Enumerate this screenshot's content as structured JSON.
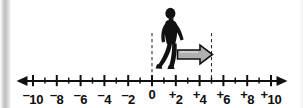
{
  "figure": {
    "background_color": "#ffffff",
    "ink_color": "#111111",
    "arrow_fill_color": "#b0b0b0",
    "arrow_stroke_color": "#111111",
    "dash_color": "#333333"
  },
  "number_line": {
    "min": -10,
    "max": 10,
    "tick_step": 1,
    "label_step": 2,
    "left_arrowhead": true,
    "right_arrowhead": true,
    "labels": [
      {
        "value": -10,
        "sign": "⁻",
        "digits": "10",
        "text": "⁻10"
      },
      {
        "value": -8,
        "sign": "⁻",
        "digits": "8",
        "text": "⁻8"
      },
      {
        "value": -6,
        "sign": "⁻",
        "digits": "6",
        "text": "⁻6"
      },
      {
        "value": -4,
        "sign": "⁻",
        "digits": "4",
        "text": "⁻4"
      },
      {
        "value": -2,
        "sign": "⁻",
        "digits": "2",
        "text": "⁻2"
      },
      {
        "value": 0,
        "sign": "",
        "digits": "0",
        "text": "0"
      },
      {
        "value": 2,
        "sign": "⁺",
        "digits": "2",
        "text": "⁺2"
      },
      {
        "value": 4,
        "sign": "⁺",
        "digits": "4",
        "text": "⁺4"
      },
      {
        "value": 6,
        "sign": "⁺",
        "digits": "6",
        "text": "⁺6"
      },
      {
        "value": 8,
        "sign": "⁺",
        "digits": "8",
        "text": "⁺8"
      },
      {
        "value": 10,
        "sign": "⁺",
        "digits": "10",
        "text": "⁺10"
      }
    ]
  },
  "figures": {
    "person": {
      "name": "walking-person",
      "position_value": 0,
      "facing": "right",
      "color": "#111111"
    },
    "motion_arrow": {
      "name": "motion-arrow",
      "from_value": 0.7,
      "to_value": 5,
      "direction": "right",
      "fill": "#b0b0b0",
      "stroke": "#111111"
    },
    "guide_lines": [
      {
        "name": "start-guide",
        "value": 0,
        "style": "dashed"
      },
      {
        "name": "end-guide",
        "value": 5,
        "style": "dashed"
      }
    ]
  },
  "chart_data": {
    "type": "line",
    "xlabel": "",
    "ylabel": "",
    "xlim": [
      -10,
      10
    ],
    "grid": false,
    "x": [
      -10,
      -9,
      -8,
      -7,
      -6,
      -5,
      -4,
      -3,
      -2,
      -1,
      0,
      1,
      2,
      3,
      4,
      5,
      6,
      7,
      8,
      9,
      10
    ],
    "tick_labels": [
      "⁻10",
      "",
      "⁻8",
      "",
      "⁻6",
      "",
      "⁻4",
      "",
      "⁻2",
      "",
      "0",
      "",
      "⁺2",
      "",
      "⁺4",
      "",
      "⁺6",
      "",
      "⁺8",
      "",
      "⁺10"
    ],
    "major_ticks": [
      -10,
      -8,
      -6,
      -4,
      -2,
      0,
      2,
      4,
      6,
      8,
      10
    ],
    "minor_ticks": [
      -9,
      -7,
      -5,
      -3,
      -1,
      1,
      3,
      5,
      7,
      9
    ],
    "annotations": [
      {
        "name": "walking-person",
        "type": "marker",
        "x": 0,
        "label": "walking person silhouette"
      },
      {
        "name": "motion-arrow",
        "type": "arrow",
        "x_start": 0,
        "x_end": 5,
        "label": "movement of +5"
      },
      {
        "name": "start-guide",
        "type": "vline",
        "x": 0,
        "style": "dashed"
      },
      {
        "name": "end-guide",
        "type": "vline",
        "x": 5,
        "style": "dashed"
      }
    ]
  }
}
